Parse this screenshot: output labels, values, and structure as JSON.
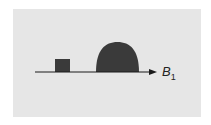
{
  "diagram": {
    "axis_label": "B",
    "axis_label_subscript": "1",
    "colors": {
      "background": "#e6e6e6",
      "shape_fill": "#3a3a3a",
      "axis": "#1a1a1a"
    },
    "shapes": [
      {
        "type": "rectangle",
        "description": "small square pulse"
      },
      {
        "type": "dome",
        "description": "large rounded pulse"
      }
    ]
  }
}
